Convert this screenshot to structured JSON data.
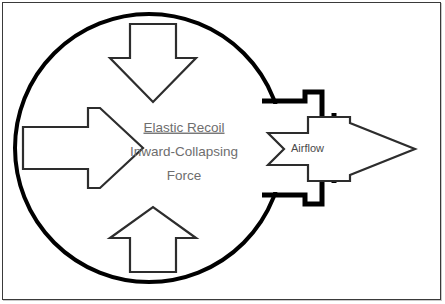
{
  "figure": {
    "title_lines": [
      "Elastic Recoil",
      "Inward-Collapsing",
      "Force"
    ],
    "line1": "Elastic Recoil",
    "line2": "Inward-Collapsing",
    "line3": "Force",
    "airflow_label": "Airflow"
  },
  "colors": {
    "frame_border": "#3a3a3a",
    "frame_shadow": "#c9c9c9",
    "background": "#ffffff",
    "alveolus_stroke": "#000000",
    "airway_stroke": "#000000",
    "arrow_stroke": "#2d2d2d",
    "arrow_fill": "#ffffff",
    "text": "#6e6e6e",
    "airflow_text": "#4a4a4a"
  },
  "geometry": {
    "canvas_width": 445,
    "canvas_height": 304,
    "circle_center_x": 149,
    "circle_center_y": 148,
    "circle_radius": 134,
    "circle_stroke_width": 4,
    "arrow_stroke_width": 2.2,
    "airway_stroke_width": 5
  },
  "elements": {
    "alveolus_name": "alveolus-circle",
    "airway_name": "airway-neck",
    "arrow_top_name": "recoil-arrow-down",
    "arrow_bottom_name": "recoil-arrow-up",
    "arrow_left_name": "recoil-arrow-right",
    "arrow_airflow_name": "airflow-arrow"
  }
}
